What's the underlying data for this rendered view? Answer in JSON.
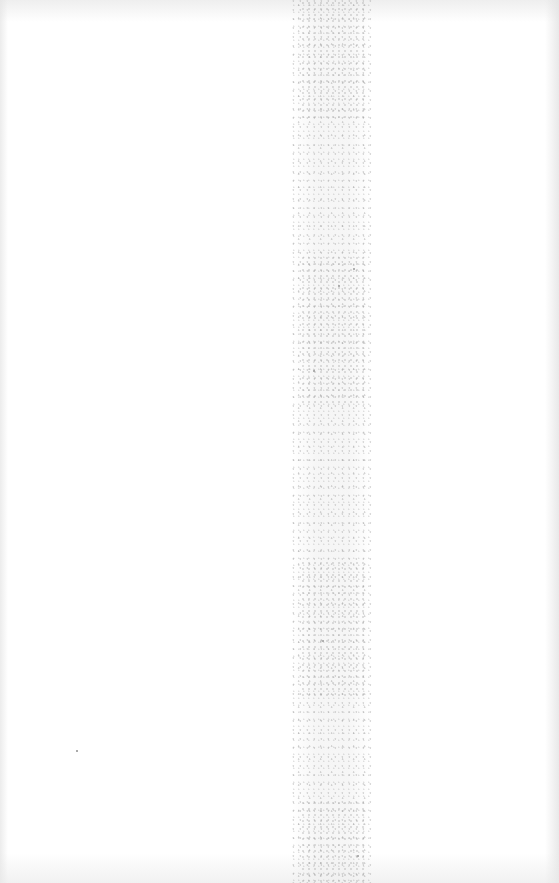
{
  "document": {
    "type": "blank-scanned-page",
    "visible_text": [],
    "colors": {
      "background": "#ffffff",
      "gutter_noise": "#b0b0b0",
      "edge_shade": "#e1e1e1"
    }
  }
}
